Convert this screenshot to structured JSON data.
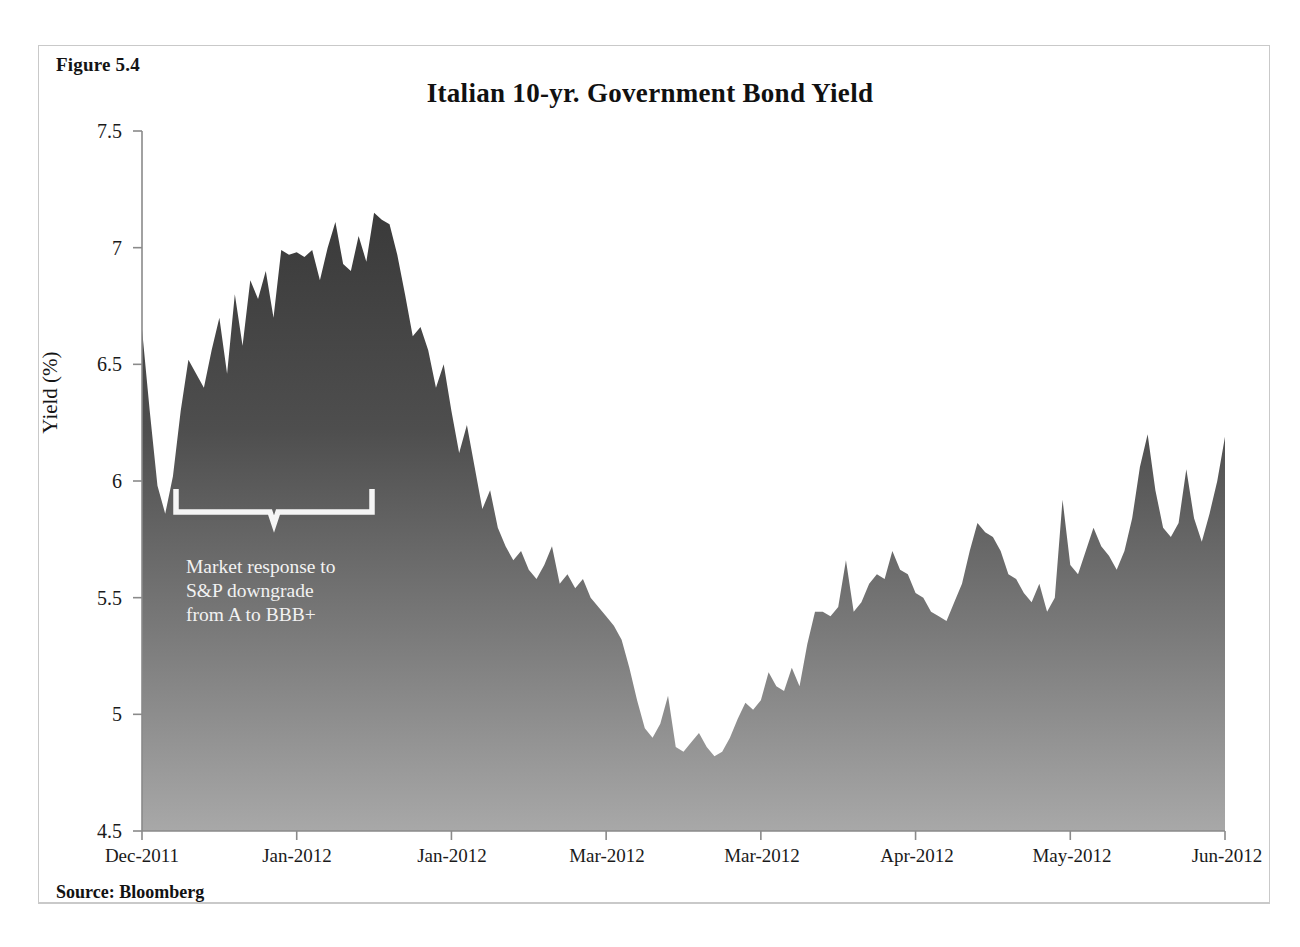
{
  "figure": {
    "label": "Figure 5.4",
    "title": "Italian 10-yr. Government  Bond Yield",
    "source": "Source: Bloomberg"
  },
  "colors": {
    "area_top": "#3d3d3d",
    "area_bottom": "#a2a2a2",
    "axis": "#7a7a7a",
    "text": "#141414",
    "annotation_text": "#f2f2f2",
    "frame": "#c9c9c9",
    "background": "#ffffff"
  },
  "annotation": {
    "line1": "Market response to",
    "line2": "S&P downgrade",
    "line3": "from A to BBB+",
    "full_text": "Market response to S&P downgrade from A to BBB+",
    "bracket_start_x": 176,
    "bracket_end_x": 372,
    "bracket_y": 498
  },
  "chart_data": {
    "type": "area",
    "title": "Italian 10-yr. Government  Bond Yield",
    "xlabel": "",
    "ylabel": "Yield (%)",
    "ylim": [
      4.5,
      7.5
    ],
    "ytick_labels": [
      "7.5",
      "7",
      "6.5",
      "6",
      "5.5",
      "5",
      "4.5"
    ],
    "ytick_values": [
      7.5,
      7,
      6.5,
      6,
      5.5,
      5,
      4.5
    ],
    "xtick_labels": [
      "Dec-2011",
      "Jan-2012",
      "Jan-2012",
      "Mar-2012",
      "Mar-2012",
      "Apr-2012",
      "May-2012",
      "Jun-2012"
    ],
    "grid": false,
    "legend": "none",
    "series_name": "Italian 10-yr Government Bond Yield",
    "values": [
      6.65,
      6.3,
      5.98,
      5.86,
      6.02,
      6.3,
      6.52,
      6.46,
      6.4,
      6.56,
      6.7,
      6.46,
      6.8,
      6.58,
      6.86,
      6.78,
      6.9,
      6.7,
      6.99,
      6.97,
      6.98,
      6.96,
      6.99,
      6.86,
      7.0,
      7.11,
      6.93,
      6.9,
      7.05,
      6.94,
      7.15,
      7.12,
      7.1,
      6.97,
      6.8,
      6.62,
      6.66,
      6.56,
      6.4,
      6.5,
      6.3,
      6.12,
      6.24,
      6.06,
      5.88,
      5.96,
      5.8,
      5.72,
      5.66,
      5.7,
      5.62,
      5.58,
      5.64,
      5.72,
      5.56,
      5.6,
      5.54,
      5.58,
      5.5,
      5.46,
      5.42,
      5.38,
      5.32,
      5.2,
      5.06,
      4.94,
      4.9,
      4.96,
      5.08,
      4.86,
      4.84,
      4.88,
      4.92,
      4.86,
      4.82,
      4.84,
      4.9,
      4.98,
      5.05,
      5.02,
      5.06,
      5.18,
      5.12,
      5.1,
      5.2,
      5.12,
      5.3,
      5.44,
      5.44,
      5.42,
      5.46,
      5.66,
      5.44,
      5.48,
      5.56,
      5.6,
      5.58,
      5.7,
      5.62,
      5.6,
      5.52,
      5.5,
      5.44,
      5.42,
      5.4,
      5.48,
      5.56,
      5.7,
      5.82,
      5.78,
      5.76,
      5.7,
      5.6,
      5.58,
      5.52,
      5.48,
      5.56,
      5.44,
      5.5,
      5.92,
      5.64,
      5.6,
      5.7,
      5.8,
      5.72,
      5.68,
      5.62,
      5.7,
      5.84,
      6.06,
      6.2,
      5.96,
      5.8,
      5.76,
      5.82,
      6.05,
      5.84,
      5.74,
      5.86,
      6.0,
      6.19
    ],
    "n_points": 141,
    "value_min": 4.82,
    "value_max": 7.15,
    "value_first": 6.65,
    "value_last": 6.19
  }
}
